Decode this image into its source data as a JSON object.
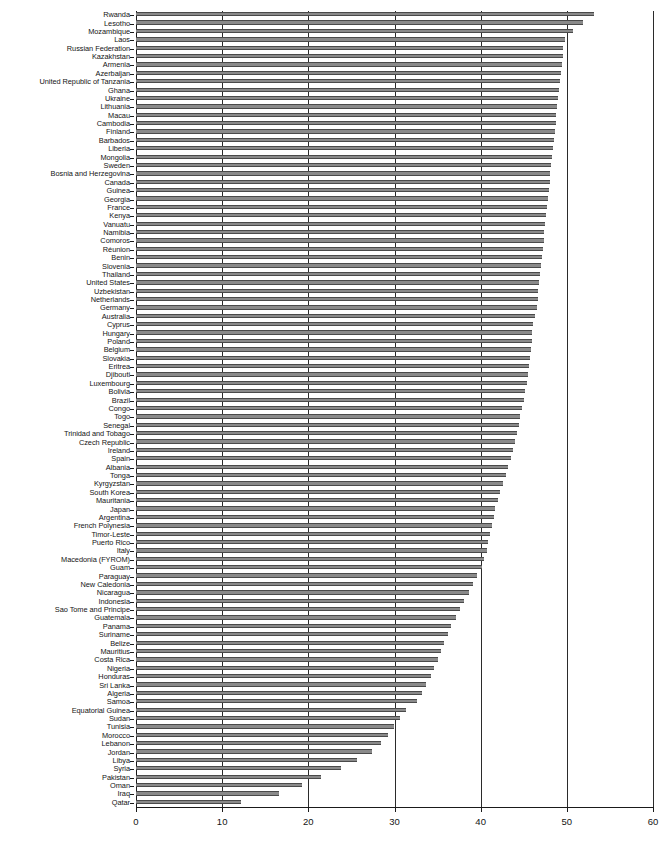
{
  "chart_data": {
    "type": "bar",
    "orientation": "horizontal",
    "title": "",
    "subtitle": "",
    "xlabel": "",
    "ylabel": "",
    "xlim": [
      0,
      60
    ],
    "ylim": null,
    "xticks": [
      0,
      10,
      20,
      30,
      40,
      50,
      60
    ],
    "xtick_labels": [
      "0",
      "10",
      "20",
      "30",
      "40",
      "50",
      "60"
    ],
    "grid": true,
    "grid_axis": "x",
    "legend": null,
    "legend_position": "none",
    "bar_color": "#8a8a8a",
    "bar_edge_color": "#4a4a4a",
    "axis_color": "#1a1a1a",
    "background_color": "#ffffff",
    "categories": [
      "Rwanda",
      "Lesotho",
      "Mozambique",
      "Laos",
      "Russian Federation",
      "Kazakhstan",
      "Armenia",
      "Azerbaijan",
      "United Republic of Tanzania",
      "Ghana",
      "Ukraine",
      "Lithuania",
      "Macau",
      "Cambodia",
      "Finland",
      "Barbados",
      "Liberia",
      "Mongolia",
      "Sweden",
      "Bosnia and Herzegovina",
      "Canada",
      "Guinea",
      "Georgia",
      "France",
      "Kenya",
      "Vanuatu",
      "Namibia",
      "Comoros",
      "Réunion",
      "Benin",
      "Slovenia",
      "Thailand",
      "United States",
      "Uzbekistan",
      "Netherlands",
      "Germany",
      "Australia",
      "Cyprus",
      "Hungary",
      "Poland",
      "Belgium",
      "Slovakia",
      "Eritrea",
      "Djibouti",
      "Luxembourg",
      "Bolivia",
      "Brazil",
      "Congo",
      "Togo",
      "Senegal",
      "Trinidad and Tobago",
      "Czech Republic",
      "Ireland",
      "Spain",
      "Albania",
      "Tonga",
      "Kyrgyzstan",
      "South Korea",
      "Mauritania",
      "Japan",
      "Argentina",
      "French Polynesia",
      "Timor-Leste",
      "Puerto Rico",
      "Italy",
      "Macedonia (FYROM)",
      "Guam",
      "Paraguay",
      "New Caledonia",
      "Nicaragua",
      "Indonesia",
      "Sao Tome and Principe",
      "Guatemala",
      "Panama",
      "Suriname",
      "Belize",
      "Mauritius",
      "Costa Rica",
      "Nigeria",
      "Honduras",
      "Sri Lanka",
      "Algeria",
      "Samoa",
      "Equatorial Guinea",
      "Sudan",
      "Tunisia",
      "Morocco",
      "Lebanon",
      "Jordan",
      "Libya",
      "Syria",
      "Pakistan",
      "Oman",
      "Iraq",
      "Qatar"
    ],
    "values": [
      53.1,
      51.9,
      50.7,
      49.8,
      49.6,
      49.5,
      49.4,
      49.3,
      49.2,
      49.1,
      49.0,
      48.9,
      48.8,
      48.7,
      48.6,
      48.5,
      48.4,
      48.3,
      48.2,
      48.1,
      48.0,
      47.9,
      47.8,
      47.7,
      47.6,
      47.5,
      47.4,
      47.3,
      47.2,
      47.1,
      47.0,
      46.9,
      46.8,
      46.7,
      46.6,
      46.5,
      46.3,
      46.1,
      46.0,
      45.9,
      45.8,
      45.7,
      45.6,
      45.5,
      45.4,
      45.2,
      45.0,
      44.8,
      44.6,
      44.4,
      44.2,
      44.0,
      43.8,
      43.5,
      43.2,
      42.9,
      42.6,
      42.3,
      42.0,
      41.7,
      41.5,
      41.3,
      41.1,
      40.9,
      40.7,
      40.4,
      40.1,
      39.6,
      39.1,
      38.6,
      38.1,
      37.6,
      37.1,
      36.6,
      36.2,
      35.8,
      35.4,
      35.0,
      34.6,
      34.2,
      33.7,
      33.2,
      32.6,
      31.3,
      30.6,
      29.9,
      29.2,
      28.4,
      27.4,
      25.7,
      23.8,
      21.5,
      19.3,
      16.6,
      12.2
    ]
  },
  "axis": {
    "x_min_label": "0",
    "x_max_label": "60"
  }
}
